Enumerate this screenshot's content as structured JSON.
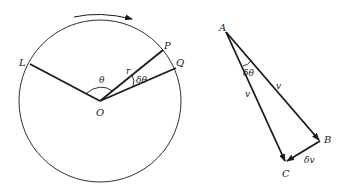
{
  "circle_diagram": {
    "center_label": "O",
    "points": {
      "L": "L",
      "P": "P",
      "Q": "Q"
    },
    "radius_label": "r",
    "angle_theta": "θ",
    "angle_delta_theta": "δθ",
    "rotation_direction": "clockwise"
  },
  "vector_triangle": {
    "vertices": {
      "A": "A",
      "B": "B",
      "C": "C"
    },
    "side_AB_label": "v",
    "side_AC_label": "v",
    "side_BC_label": "δv",
    "apex_angle": "δθ"
  },
  "colors": {
    "stroke": "#1a1a1a",
    "background": "#ffffff"
  }
}
